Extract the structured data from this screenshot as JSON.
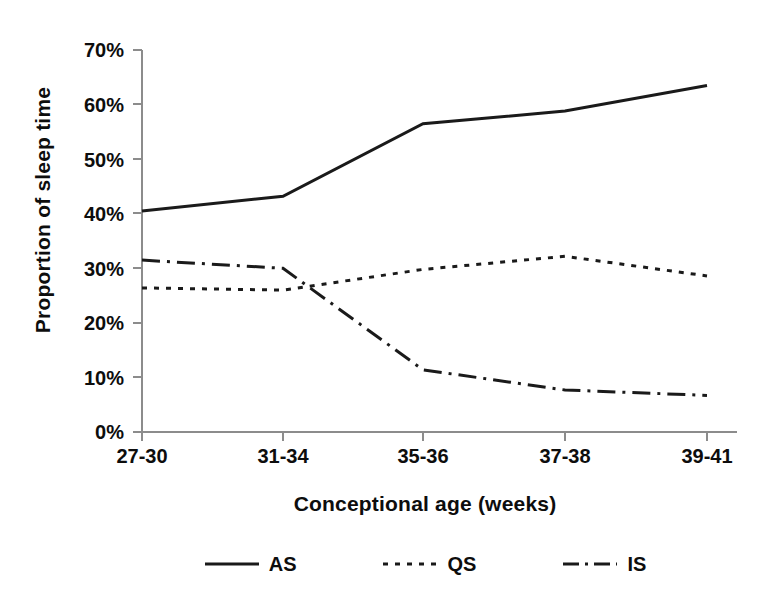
{
  "chart_data": {
    "type": "line",
    "title": "",
    "xlabel": "Conceptional age (weeks)",
    "ylabel": "Proportion of sleep time",
    "categories": [
      "27-30",
      "31-34",
      "35-36",
      "37-38",
      "39-41"
    ],
    "ylim": [
      0,
      70
    ],
    "ytick_labels": [
      "0%",
      "10%",
      "20%",
      "30%",
      "40%",
      "50%",
      "60%",
      "70%"
    ],
    "ytick_values": [
      0,
      10,
      20,
      30,
      40,
      50,
      60,
      70
    ],
    "grid": false,
    "legend_position": "bottom",
    "series": [
      {
        "name": "AS",
        "style": "solid",
        "values": [
          40.5,
          43.2,
          56.5,
          58.8,
          63.5
        ]
      },
      {
        "name": "QS",
        "style": "dotted",
        "values": [
          26.4,
          26.0,
          29.8,
          32.2,
          28.6
        ]
      },
      {
        "name": "IS",
        "style": "dash-dot",
        "values": [
          31.5,
          30.0,
          11.4,
          7.7,
          6.7
        ]
      }
    ]
  },
  "axes": {
    "y_title": "Proportion of sleep time",
    "x_title": "Conceptional age (weeks)",
    "y_ticks": [
      {
        "label": "70%"
      },
      {
        "label": "60%"
      },
      {
        "label": "50%"
      },
      {
        "label": "40%"
      },
      {
        "label": "30%"
      },
      {
        "label": "20%"
      },
      {
        "label": "10%"
      },
      {
        "label": "0%"
      }
    ],
    "x_ticks": [
      {
        "label": "27-30"
      },
      {
        "label": "31-34"
      },
      {
        "label": "35-36"
      },
      {
        "label": "37-38"
      },
      {
        "label": "39-41"
      }
    ]
  },
  "legend": {
    "entries": [
      {
        "label": "AS",
        "style": "solid"
      },
      {
        "label": "QS",
        "style": "dotted"
      },
      {
        "label": "IS",
        "style": "dash-dot"
      }
    ]
  },
  "colors": {
    "line": "#1a1a1a",
    "axis": "#8c8c8c",
    "text": "#0d0d0d",
    "background": "#ffffff"
  }
}
